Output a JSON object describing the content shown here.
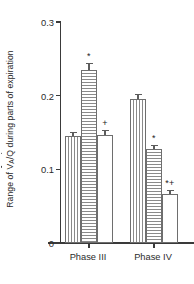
{
  "chart_data": {
    "type": "bar",
    "title": "",
    "xlabel": "",
    "ylabel": "Range of VA/Q during parts of expiration",
    "ylabel_parts": {
      "prefix": "Range of ",
      "v": "V",
      "v_sub": "A",
      "slash": "/",
      "q": "Q",
      "suffix": " during parts of expiration"
    },
    "categories": [
      "Phase III",
      "Phase IV"
    ],
    "ylim": [
      0,
      0.3
    ],
    "yticks": [
      0,
      0.1,
      0.2,
      0.3
    ],
    "ytick_labels": [
      "0",
      "0.1",
      "0.2",
      "0.3"
    ],
    "grid": false,
    "legend": "none",
    "series": [
      {
        "name": "bar-1",
        "fill": "vertical-hatch",
        "values": [
          0.145,
          0.195
        ],
        "errors": [
          0.006,
          0.007
        ],
        "annotations": [
          "",
          ""
        ]
      },
      {
        "name": "bar-2",
        "fill": "horizontal-hatch",
        "values": [
          0.235,
          0.127
        ],
        "errors": [
          0.009,
          0.006
        ],
        "annotations": [
          "*",
          "*"
        ]
      },
      {
        "name": "bar-3",
        "fill": "plain-white",
        "values": [
          0.147,
          0.067
        ],
        "errors": [
          0.007,
          0.005
        ],
        "annotations": [
          "+",
          "*+"
        ]
      }
    ]
  },
  "colors": {
    "axis": "#3a3a3a",
    "bar_outline": "#6e6e6e",
    "hatch": "#8a8a8a",
    "error_bar": "#5c5c5c",
    "text": "#2b2b2b",
    "background": "#ffffff"
  }
}
